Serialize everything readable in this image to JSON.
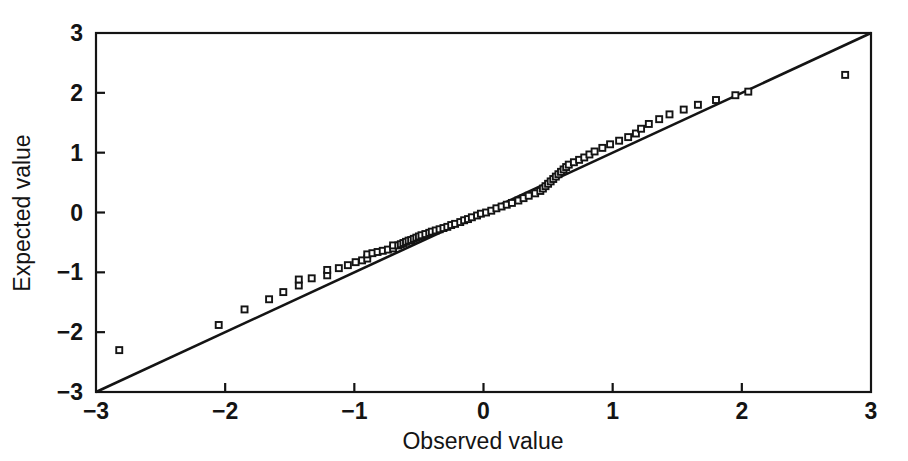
{
  "chart_data": {
    "type": "scatter",
    "title": "",
    "subtitle": "",
    "xlabel": "Observed value",
    "ylabel": "Expected value",
    "xlim": [
      -3,
      3
    ],
    "ylim": [
      -3,
      3
    ],
    "xticks": [
      -3,
      -2,
      -1,
      0,
      1,
      2,
      3
    ],
    "yticks": [
      -3,
      -2,
      -1,
      0,
      1,
      2,
      3
    ],
    "xticklabels": [
      "−3",
      "−2",
      "−1",
      "0",
      "1",
      "2",
      "3"
    ],
    "yticklabels": [
      "−3",
      "−2",
      "−1",
      "0",
      "1",
      "2",
      "3"
    ],
    "grid": false,
    "legend": null,
    "annotations": [],
    "marker": "open-square",
    "marker_size": 6,
    "series": [
      {
        "name": "Normal Q-Q points",
        "x": [
          -2.82,
          -2.05,
          -1.85,
          -1.66,
          -1.55,
          -1.43,
          -1.43,
          -1.33,
          -1.21,
          -1.21,
          -1.12,
          -1.05,
          -0.99,
          -0.94,
          -0.9,
          -0.9,
          -0.86,
          -0.82,
          -0.78,
          -0.74,
          -0.7,
          -0.7,
          -0.66,
          -0.64,
          -0.62,
          -0.6,
          -0.58,
          -0.56,
          -0.54,
          -0.52,
          -0.5,
          -0.48,
          -0.45,
          -0.42,
          -0.4,
          -0.37,
          -0.34,
          -0.31,
          -0.28,
          -0.25,
          -0.22,
          -0.18,
          -0.15,
          -0.12,
          -0.09,
          -0.05,
          -0.02,
          0.02,
          0.06,
          0.1,
          0.14,
          0.18,
          0.22,
          0.27,
          0.31,
          0.35,
          0.4,
          0.44,
          0.46,
          0.48,
          0.5,
          0.52,
          0.54,
          0.56,
          0.58,
          0.6,
          0.62,
          0.64,
          0.66,
          0.7,
          0.74,
          0.78,
          0.82,
          0.86,
          0.92,
          0.98,
          1.05,
          1.12,
          1.18,
          1.22,
          1.28,
          1.36,
          1.44,
          1.55,
          1.66,
          1.8,
          1.95,
          2.05,
          2.8
        ],
        "y": [
          -2.3,
          -1.88,
          -1.62,
          -1.45,
          -1.33,
          -1.22,
          -1.12,
          -1.1,
          -1.05,
          -0.96,
          -0.93,
          -0.88,
          -0.83,
          -0.8,
          -0.77,
          -0.7,
          -0.68,
          -0.66,
          -0.64,
          -0.62,
          -0.6,
          -0.55,
          -0.55,
          -0.53,
          -0.51,
          -0.49,
          -0.47,
          -0.46,
          -0.44,
          -0.42,
          -0.4,
          -0.38,
          -0.36,
          -0.34,
          -0.32,
          -0.3,
          -0.28,
          -0.26,
          -0.24,
          -0.21,
          -0.19,
          -0.16,
          -0.13,
          -0.11,
          -0.08,
          -0.05,
          -0.02,
          0.0,
          0.03,
          0.07,
          0.1,
          0.13,
          0.16,
          0.2,
          0.24,
          0.28,
          0.32,
          0.36,
          0.4,
          0.44,
          0.48,
          0.52,
          0.56,
          0.6,
          0.64,
          0.68,
          0.72,
          0.76,
          0.8,
          0.84,
          0.88,
          0.92,
          0.97,
          1.02,
          1.08,
          1.14,
          1.2,
          1.26,
          1.32,
          1.4,
          1.48,
          1.56,
          1.64,
          1.72,
          1.8,
          1.88,
          1.96,
          2.02,
          2.3
        ]
      }
    ],
    "reference_line": {
      "name": "identity-line",
      "from": [
        -3,
        -3
      ],
      "to": [
        3,
        3
      ]
    }
  },
  "colors": {
    "ink": "#141414",
    "background": "#ffffff",
    "marker_fill": "#ffffff"
  }
}
